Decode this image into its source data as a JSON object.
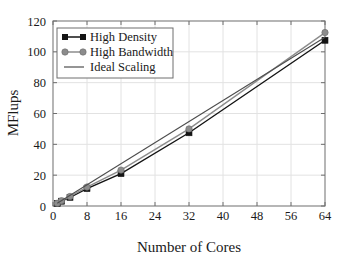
{
  "chart_data": {
    "type": "line",
    "title": "",
    "xlabel": "Number of Cores",
    "ylabel": "MFlups",
    "xlim": [
      0,
      64
    ],
    "ylim": [
      0,
      120
    ],
    "xticks": [
      0,
      8,
      16,
      24,
      32,
      40,
      48,
      56,
      64
    ],
    "xtick_labels": [
      "0",
      "8",
      "16",
      "24",
      "32",
      "40",
      "48",
      "56",
      "64"
    ],
    "yticks": [
      0,
      20,
      40,
      60,
      80,
      100,
      120
    ],
    "ytick_labels": [
      "0",
      "20",
      "40",
      "60",
      "80",
      "100",
      "120"
    ],
    "grid": true,
    "grid_color": "#e2e2e2",
    "legend_position": "upper left",
    "series": [
      {
        "name": "High Density",
        "marker": "square",
        "color": "#141414",
        "x": [
          1,
          2,
          4,
          8,
          16,
          32,
          64
        ],
        "values": [
          1.7,
          3.1,
          5.6,
          11.3,
          21.0,
          47.5,
          107.5
        ]
      },
      {
        "name": "High Bandwidth",
        "marker": "circle",
        "color": "#8c8c8c",
        "x": [
          1,
          2,
          4,
          8,
          16,
          32,
          64
        ],
        "values": [
          1.8,
          3.4,
          6.2,
          12.3,
          23.3,
          50.0,
          112.5
        ]
      },
      {
        "name": "Ideal Scaling",
        "marker": "none",
        "color": "#4d4d4d",
        "x": [
          1,
          64
        ],
        "values": [
          1.8,
          109.5
        ]
      }
    ]
  },
  "legend": {
    "entries": [
      {
        "label": "High Density"
      },
      {
        "label": "High Bandwidth"
      },
      {
        "label": "Ideal Scaling"
      }
    ]
  },
  "axes": {
    "x_title": "Number of Cores",
    "y_title": "MFlups"
  }
}
